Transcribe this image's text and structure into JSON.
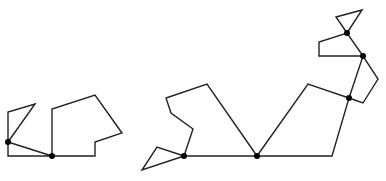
{
  "diagram": {
    "width": 386,
    "height": 181,
    "stroke_color": "#222222",
    "dot_color": "#000000",
    "figures": [
      {
        "name": "small-figure",
        "polylines": [
          [
            [
              8,
              142
            ],
            [
              8,
              112
            ],
            [
              35,
              104
            ],
            [
              8,
              142
            ]
          ],
          [
            [
              8,
              142
            ],
            [
              52,
              156
            ],
            [
              8,
              156
            ],
            [
              8,
              142
            ]
          ],
          [
            [
              52,
              156
            ],
            [
              52,
              109
            ],
            [
              95,
              95
            ],
            [
              122,
              133
            ],
            [
              95,
              142
            ],
            [
              95,
              156
            ],
            [
              52,
              156
            ]
          ]
        ],
        "joints": [
          [
            8,
            142
          ],
          [
            52,
            156
          ]
        ]
      },
      {
        "name": "large-figure",
        "polylines": [
          [
            [
              184,
              156
            ],
            [
              142,
              170
            ],
            [
              157,
              147
            ],
            [
              184,
              156
            ]
          ],
          [
            [
              184,
              156
            ],
            [
              193,
              129
            ],
            [
              171,
              113
            ],
            [
              166,
              98
            ],
            [
              207,
              84
            ],
            [
              257,
              156
            ]
          ],
          [
            [
              184,
              156
            ],
            [
              257,
              156
            ]
          ],
          [
            [
              257,
              156
            ],
            [
              308,
              84
            ],
            [
              349,
              98
            ],
            [
              332,
              156
            ],
            [
              257,
              156
            ]
          ],
          [
            [
              349,
              98
            ],
            [
              363,
              103
            ],
            [
              378,
              79
            ],
            [
              363,
              56
            ],
            [
              349,
              98
            ]
          ],
          [
            [
              363,
              56
            ],
            [
              319,
              56
            ],
            [
              319,
              42
            ],
            [
              347,
              33
            ],
            [
              363,
              56
            ]
          ],
          [
            [
              347,
              33
            ],
            [
              336,
              17
            ],
            [
              362,
              10
            ],
            [
              347,
              33
            ]
          ]
        ],
        "joints": [
          [
            184,
            156
          ],
          [
            257,
            156
          ],
          [
            349,
            98
          ],
          [
            363,
            56
          ],
          [
            347,
            33
          ]
        ]
      }
    ]
  }
}
